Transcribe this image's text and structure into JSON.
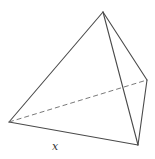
{
  "figure": {
    "type": "tetrahedron",
    "vertices": {
      "top": [
        103,
        12
      ],
      "left": [
        9,
        122
      ],
      "right": [
        147,
        80
      ],
      "bottom": [
        138,
        145
      ]
    },
    "visible_edges": [
      [
        "top",
        "left"
      ],
      [
        "top",
        "right"
      ],
      [
        "top",
        "bottom"
      ],
      [
        "left",
        "bottom"
      ],
      [
        "right",
        "bottom"
      ]
    ],
    "hidden_edges": [
      [
        "left",
        "right"
      ]
    ],
    "labels": {
      "edge_label": "x"
    },
    "colors": {
      "edge": "#4a4a4a",
      "hidden_edge": "#6a6a6a",
      "label": "#333333"
    }
  }
}
